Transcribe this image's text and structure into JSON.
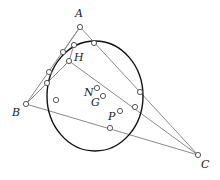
{
  "diagram": {
    "type": "geometry",
    "colors": {
      "lines": "#8a8a8a",
      "circle": "#111111",
      "points_fill": "#ffffff",
      "points_stroke": "#444444",
      "labels": "#222222"
    },
    "circle": {
      "cx": 95,
      "cy": 96,
      "rx": 48,
      "ry": 55
    },
    "labels": [
      {
        "id": "A",
        "text": "A",
        "x": 75,
        "y": 17
      },
      {
        "id": "B",
        "text": "B",
        "x": 12,
        "y": 116
      },
      {
        "id": "C",
        "text": "C",
        "x": 201,
        "y": 168
      },
      {
        "id": "H",
        "text": "H",
        "x": 74,
        "y": 61
      },
      {
        "id": "N",
        "text": "N",
        "x": 84,
        "y": 96
      },
      {
        "id": "G",
        "text": "G",
        "x": 91,
        "y": 106
      },
      {
        "id": "P",
        "text": "P",
        "x": 108,
        "y": 120
      }
    ],
    "points": [
      {
        "id": "A",
        "x": 80,
        "y": 27
      },
      {
        "id": "B",
        "x": 26,
        "y": 104
      },
      {
        "id": "C",
        "x": 198,
        "y": 155
      },
      {
        "id": "H",
        "x": 69,
        "y": 61
      },
      {
        "id": "N",
        "x": 97,
        "y": 88
      },
      {
        "id": "G",
        "x": 103,
        "y": 96
      },
      {
        "id": "P",
        "x": 120,
        "y": 111
      },
      {
        "id": "c1",
        "x": 74,
        "y": 45
      },
      {
        "id": "c2",
        "x": 94,
        "y": 43
      },
      {
        "id": "c3",
        "x": 63,
        "y": 52
      },
      {
        "id": "c4",
        "x": 49,
        "y": 72
      },
      {
        "id": "c5",
        "x": 47,
        "y": 83
      },
      {
        "id": "c6",
        "x": 56,
        "y": 100
      },
      {
        "id": "c7",
        "x": 110,
        "y": 128
      },
      {
        "id": "c8",
        "x": 140,
        "y": 92
      },
      {
        "id": "c9",
        "x": 135,
        "y": 107
      }
    ],
    "segments": [
      [
        "A",
        "B"
      ],
      [
        "A",
        "C"
      ],
      [
        "B",
        "C"
      ],
      [
        "B",
        "H"
      ],
      [
        "H",
        "C"
      ],
      [
        "A",
        "c3"
      ],
      [
        "H",
        "c1"
      ]
    ]
  }
}
